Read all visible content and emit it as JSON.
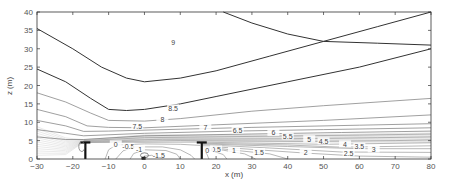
{
  "chart_data": {
    "type": "contour",
    "title": "",
    "xlabel": "x (m)",
    "ylabel": "z (m)",
    "xlim": [
      -30,
      80
    ],
    "ylim": [
      0,
      40
    ],
    "xticks": [
      -30,
      -20,
      -10,
      0,
      10,
      20,
      30,
      40,
      50,
      60,
      70,
      80
    ],
    "yticks": [
      0,
      5,
      10,
      15,
      20,
      25,
      30,
      35,
      40
    ],
    "grid": false,
    "contour_levels": [
      -1.5,
      -1,
      -0.5,
      0,
      0.5,
      1,
      1.5,
      2,
      2.5,
      3,
      3.5,
      4,
      4.5,
      5,
      5.5,
      6,
      6.5,
      7,
      7.5,
      8,
      8.5,
      9
    ],
    "contours": [
      {
        "level": 9,
        "points": [
          [
            -30,
            35.5
          ],
          [
            -20,
            30
          ],
          [
            -12,
            25
          ],
          [
            -5,
            22
          ],
          [
            0,
            21
          ],
          [
            10,
            22
          ],
          [
            20,
            24
          ],
          [
            35,
            28
          ],
          [
            50,
            32
          ],
          [
            65,
            36
          ],
          [
            80,
            40
          ]
        ]
      },
      {
        "level": 9,
        "points": [
          [
            22,
            40
          ],
          [
            30,
            37
          ],
          [
            40,
            34
          ],
          [
            50,
            32
          ],
          [
            65,
            31.5
          ],
          [
            80,
            31
          ]
        ]
      },
      {
        "level": 8.5,
        "points": [
          [
            -30,
            24.5
          ],
          [
            -22,
            21
          ],
          [
            -15,
            16.5
          ],
          [
            -10,
            13.5
          ],
          [
            -5,
            13.2
          ],
          [
            0,
            13.5
          ],
          [
            10,
            15
          ],
          [
            20,
            17
          ],
          [
            40,
            21
          ],
          [
            60,
            25
          ],
          [
            80,
            30
          ]
        ]
      },
      {
        "level": 8,
        "points": [
          [
            -30,
            18
          ],
          [
            -22,
            15.5
          ],
          [
            -15,
            12.5
          ],
          [
            -10,
            10.5
          ],
          [
            0,
            10.3
          ],
          [
            10,
            11
          ],
          [
            30,
            13
          ],
          [
            50,
            14.5
          ],
          [
            80,
            16.5
          ]
        ]
      },
      {
        "level": 7.5,
        "points": [
          [
            -30,
            13.5
          ],
          [
            -22,
            11.5
          ],
          [
            -16,
            9
          ],
          [
            -10,
            8.6
          ],
          [
            0,
            8.5
          ],
          [
            20,
            9.3
          ],
          [
            50,
            10.5
          ],
          [
            80,
            12
          ]
        ]
      },
      {
        "level": 7,
        "points": [
          [
            -30,
            10.5
          ],
          [
            -22,
            9
          ],
          [
            -17,
            7.5
          ],
          [
            -10,
            7.6
          ],
          [
            10,
            8.1
          ],
          [
            30,
            8.6
          ],
          [
            60,
            9.2
          ],
          [
            80,
            9.6
          ]
        ]
      },
      {
        "level": 6.5,
        "points": [
          [
            -30,
            8
          ],
          [
            -22,
            7
          ],
          [
            -17,
            6.3
          ],
          [
            0,
            7
          ],
          [
            25,
            7.6
          ],
          [
            50,
            8
          ],
          [
            80,
            8.5
          ]
        ]
      },
      {
        "level": 6,
        "points": [
          [
            -30,
            6
          ],
          [
            -22,
            5.3
          ],
          [
            -17,
            5.3
          ],
          [
            0,
            6.3
          ],
          [
            30,
            6.8
          ],
          [
            55,
            7.2
          ],
          [
            80,
            7.6
          ]
        ]
      },
      {
        "level": 5.5,
        "points": [
          [
            -17,
            5
          ],
          [
            0,
            5.8
          ],
          [
            35,
            6.2
          ],
          [
            60,
            6.5
          ],
          [
            80,
            6.8
          ]
        ]
      },
      {
        "level": 5,
        "points": [
          [
            -17,
            4.8
          ],
          [
            5,
            5.4
          ],
          [
            40,
            5.5
          ],
          [
            65,
            5.8
          ],
          [
            80,
            6
          ]
        ]
      },
      {
        "level": 4.5,
        "points": [
          [
            -17,
            4.6
          ],
          [
            10,
            5
          ],
          [
            45,
            4.8
          ],
          [
            70,
            5
          ],
          [
            80,
            5.2
          ]
        ]
      },
      {
        "level": 4,
        "points": [
          [
            -17,
            4.5
          ],
          [
            15,
            4.6
          ],
          [
            50,
            4
          ],
          [
            80,
            4.4
          ]
        ]
      },
      {
        "level": 3.5,
        "points": [
          [
            16,
            4.3
          ],
          [
            40,
            3.8
          ],
          [
            55,
            3.2
          ],
          [
            80,
            3.6
          ]
        ]
      },
      {
        "level": 3,
        "points": [
          [
            16,
            4.1
          ],
          [
            40,
            3.4
          ],
          [
            60,
            2.8
          ],
          [
            80,
            2.8
          ]
        ]
      },
      {
        "level": 2.5,
        "points": [
          [
            16,
            3.9
          ],
          [
            35,
            3
          ],
          [
            55,
            1.9
          ],
          [
            80,
            1.8
          ]
        ]
      },
      {
        "level": 2,
        "points": [
          [
            16,
            3.6
          ],
          [
            30,
            2.6
          ],
          [
            45,
            1.6
          ],
          [
            60,
            0.8
          ],
          [
            80,
            0.5
          ]
        ]
      },
      {
        "level": 1.5,
        "points": [
          [
            16,
            3.4
          ],
          [
            25,
            2.4
          ],
          [
            35,
            1.4
          ],
          [
            40,
            0
          ]
        ]
      },
      {
        "level": 1,
        "points": [
          [
            16,
            3.1
          ],
          [
            22,
            2.4
          ],
          [
            28,
            1.4
          ],
          [
            31,
            0
          ]
        ]
      },
      {
        "level": 0.5,
        "points": [
          [
            16,
            2.8
          ],
          [
            19,
            2.2
          ],
          [
            22,
            1.2
          ],
          [
            23,
            0
          ]
        ]
      },
      {
        "level": 0,
        "points": [
          [
            -11,
            0
          ],
          [
            -10,
            2.5
          ],
          [
            -8,
            3.8
          ],
          [
            0,
            4.1
          ],
          [
            10,
            4
          ],
          [
            15.5,
            3.7
          ]
        ]
      },
      {
        "level": 0,
        "points": [
          [
            16.5,
            2.5
          ],
          [
            17.5,
            1.2
          ],
          [
            18,
            0
          ]
        ]
      },
      {
        "level": -0.5,
        "points": [
          [
            -8,
            0
          ],
          [
            -6,
            2.2
          ],
          [
            -3,
            3.3
          ],
          [
            5,
            3.3
          ],
          [
            10,
            2.5
          ],
          [
            13,
            1
          ],
          [
            14,
            0
          ]
        ]
      },
      {
        "level": -1,
        "points": [
          [
            -4,
            0
          ],
          [
            -3,
            1.5
          ],
          [
            0,
            2.5
          ],
          [
            6,
            2.3
          ],
          [
            9,
            1.3
          ],
          [
            10,
            0
          ]
        ]
      },
      {
        "level": -1.5,
        "points": [
          [
            -1,
            0
          ],
          [
            0,
            0.8
          ],
          [
            2,
            1
          ],
          [
            4,
            0.6
          ],
          [
            5,
            0
          ]
        ]
      }
    ],
    "contour_labels": [
      {
        "text": "9",
        "x": 8,
        "z": 31.8
      },
      {
        "text": "8.5",
        "x": 8,
        "z": 13.8
      },
      {
        "text": "8",
        "x": 5,
        "z": 10.8
      },
      {
        "text": "7.5",
        "x": -2,
        "z": 8.9
      },
      {
        "text": "7",
        "x": 17,
        "z": 8.5
      },
      {
        "text": "6.5",
        "x": 26,
        "z": 7.8
      },
      {
        "text": "6",
        "x": 36,
        "z": 7.1
      },
      {
        "text": "5.5",
        "x": 40,
        "z": 6.1
      },
      {
        "text": "5",
        "x": 46,
        "z": 5.4
      },
      {
        "text": "4.5",
        "x": 50,
        "z": 4.8
      },
      {
        "text": "4",
        "x": 56,
        "z": 4.0
      },
      {
        "text": "3.5",
        "x": 60,
        "z": 3.3
      },
      {
        "text": "3",
        "x": 64,
        "z": 2.6
      },
      {
        "text": "2.5",
        "x": 57,
        "z": 1.6
      },
      {
        "text": "2",
        "x": 45,
        "z": 1.8
      },
      {
        "text": "1.5",
        "x": 32,
        "z": 1.9
      },
      {
        "text": "1",
        "x": 25,
        "z": 2.2
      },
      {
        "text": "0.5",
        "x": 20,
        "z": 2.6
      },
      {
        "text": "0",
        "x": 17.5,
        "z": 2.4
      },
      {
        "text": "0",
        "x": -8,
        "z": 4.0
      },
      {
        "text": "-0.5",
        "x": -4.5,
        "z": 3.3
      },
      {
        "text": "-1",
        "x": -1.5,
        "z": 2.7
      },
      {
        "text": "-1.5",
        "x": 4,
        "z": 0.9
      }
    ],
    "structures": [
      {
        "name": "left-post",
        "x": -16.5,
        "z_top": 4.5
      },
      {
        "name": "right-post",
        "x": 16,
        "z_top": 4.5
      }
    ]
  }
}
